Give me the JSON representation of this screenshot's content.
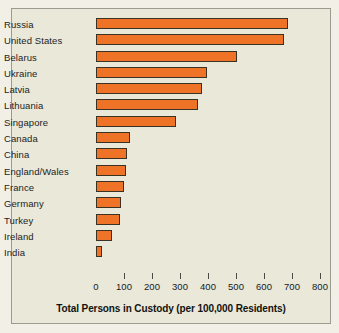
{
  "chart_data": {
    "type": "bar",
    "orientation": "horizontal",
    "title": "",
    "xlabel": "Total Persons in Custody (per 100,000 Residents)",
    "ylabel": "",
    "categories": [
      "Russia",
      "United States",
      "Belarus",
      "Ukraine",
      "Latvia",
      "Lithuania",
      "Singapore",
      "Canada",
      "China",
      "England/Wales",
      "France",
      "Germany",
      "Turkey",
      "Ireland",
      "India"
    ],
    "values": [
      685,
      670,
      505,
      395,
      380,
      365,
      287,
      123,
      112,
      106,
      101,
      90,
      85,
      57,
      23
    ],
    "xlim": [
      0,
      800
    ],
    "xticks": [
      0,
      100,
      200,
      300,
      400,
      500,
      600,
      700,
      800
    ],
    "xtick_labels": [
      "0",
      "100",
      "200",
      "300",
      "400",
      "500",
      "600",
      "700",
      "800"
    ],
    "grid": false,
    "legend": false,
    "bar_color": "#ee7326",
    "bar_edge_color": "#3b3226",
    "plot_background": "#e9e8d9",
    "frame_color": "#9b9a90"
  }
}
